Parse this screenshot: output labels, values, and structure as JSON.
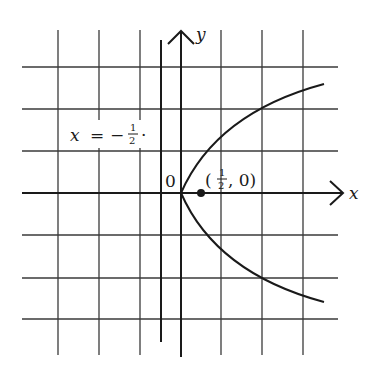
{
  "figure": {
    "colors": {
      "background": "#ffffff",
      "ink": "#1a1a1a",
      "grid": "#3a3a3a"
    },
    "axes": {
      "x_label": "x",
      "y_label": "y",
      "origin_label": "0"
    },
    "directrix": {
      "label_var": "x",
      "label_eq": "=",
      "label_sign": "−",
      "label_num": "1",
      "label_den": "2",
      "label_dot": "·",
      "x_value": -0.5
    },
    "focus": {
      "label_open": "(",
      "label_num": "1",
      "label_den": "2",
      "label_rest": ", 0)",
      "x_value": 0.5,
      "y_value": 0
    },
    "curve": {
      "equation": "y^2 = 2x",
      "y_range": [
        -2.65,
        2.65
      ]
    },
    "grid": {
      "unit_px": 41,
      "x_lines": [
        -3,
        -2,
        -1,
        1,
        2,
        3
      ],
      "y_lines": [
        3,
        2,
        1,
        -1,
        -2,
        -3
      ]
    }
  }
}
